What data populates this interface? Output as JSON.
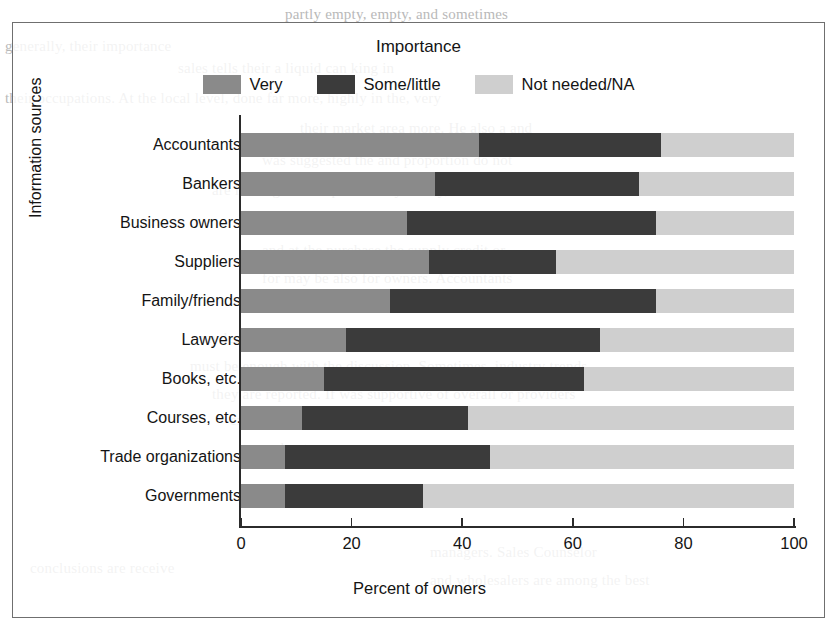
{
  "figure": {
    "legend_title": "Importance",
    "x_axis_title": "Percent of owners",
    "y_axis_title": "Information sources",
    "frame_color": "#6f6f6f"
  },
  "legend": {
    "items": [
      {
        "label": "Very",
        "color": "#8a8a8a",
        "name": "legend-swatch-very"
      },
      {
        "label": "Some/little",
        "color": "#3b3b3b",
        "name": "legend-swatch-some-little"
      },
      {
        "label": "Not needed/NA",
        "color": "#cfcfcf",
        "name": "legend-swatch-not-needed"
      }
    ]
  },
  "axis": {
    "x_ticks": [
      "0",
      "20",
      "40",
      "60",
      "80",
      "100"
    ],
    "x_tick_values": [
      0,
      20,
      40,
      60,
      80,
      100
    ]
  },
  "chart_data": {
    "type": "bar",
    "orientation": "horizontal",
    "stacked": true,
    "stack_total": 100,
    "title": "",
    "legend_title": "Importance",
    "legend_position": "top-center",
    "grid": false,
    "xlabel": "Percent of owners",
    "ylabel": "Information sources",
    "xlim": [
      0,
      100
    ],
    "categories": [
      "Accountants",
      "Bankers",
      "Business owners",
      "Suppliers",
      "Family/friends",
      "Lawyers",
      "Books, etc.",
      "Courses, etc.",
      "Trade organizations",
      "Governments"
    ],
    "series": [
      {
        "name": "Very",
        "color": "#8a8a8a",
        "values": [
          43,
          35,
          30,
          34,
          27,
          19,
          15,
          11,
          8,
          8
        ]
      },
      {
        "name": "Some/little",
        "color": "#3b3b3b",
        "values": [
          33,
          37,
          45,
          23,
          48,
          46,
          47,
          30,
          37,
          25
        ]
      },
      {
        "name": "Not needed/NA",
        "color": "#cfcfcf",
        "values": [
          24,
          28,
          25,
          43,
          25,
          35,
          38,
          59,
          55,
          67
        ]
      }
    ]
  },
  "page_bleed": {
    "lines": [
      {
        "text": "partly empty, empty, and sometimes",
        "x": 285,
        "y": 2
      },
      {
        "text": "generally, their importance",
        "x": 5,
        "y": 34
      },
      {
        "text": "sales tells their a liquid can king in",
        "x": 178,
        "y": 56
      },
      {
        "text": "their occupations. At the local level, done far more, highly in the, very",
        "x": 5,
        "y": 86
      },
      {
        "text": "their market area more. He also a and",
        "x": 300,
        "y": 116
      },
      {
        "text": "was suggested the and proportion do not",
        "x": 262,
        "y": 148
      },
      {
        "text": "are less significant placed may to buy, one of",
        "x": 212,
        "y": 178
      },
      {
        "text": "be able to see into account and. Trade",
        "x": 262,
        "y": 208
      },
      {
        "text": "and at the purchase the supply credit or",
        "x": 262,
        "y": 238
      },
      {
        "text": "for may be also for owners. Accountants",
        "x": 262,
        "y": 266
      },
      {
        "text": "be noted that a business of owners of",
        "x": 262,
        "y": 296
      },
      {
        "text": "my leaves to consider additional sources. Importantly, consultants",
        "x": 200,
        "y": 326
      },
      {
        "text": "must be enough with the discussion. Sometimes, industry trends",
        "x": 190,
        "y": 354
      },
      {
        "text": "they are reported. If was supportive of overall or providers",
        "x": 212,
        "y": 382
      },
      {
        "text": "expertise if that matter. Business owners as also. By",
        "x": 230,
        "y": 408
      },
      {
        "text": "and not",
        "x": 262,
        "y": 436
      },
      {
        "text": "conclusions are receive",
        "x": 30,
        "y": 556
      },
      {
        "text": "and wholesalers are among the best",
        "x": 430,
        "y": 568
      },
      {
        "text": "managers. Sales Counselor",
        "x": 430,
        "y": 540
      }
    ]
  }
}
